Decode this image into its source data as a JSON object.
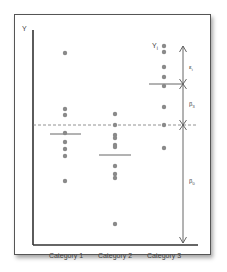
{
  "diagram": {
    "y_axis_label": "Y",
    "point_label": "Y",
    "point_label_sub": "i",
    "categories": [
      "Category 1",
      "Category 2",
      "Category 3"
    ],
    "annotations": {
      "epsilon": {
        "symbol": "ε",
        "sub": "i"
      },
      "beta3": {
        "symbol": "β",
        "sub": "3"
      },
      "beta0": {
        "symbol": "β",
        "sub": "0"
      }
    },
    "colors": {
      "dot": "#8a8a8a",
      "axis": "#333333",
      "mean_line": "#666666",
      "dashed": "#777777"
    }
  },
  "chart_data": {
    "type": "scatter",
    "title": "",
    "xlabel": "",
    "ylabel": "Y",
    "categories": [
      "Category 1",
      "Category 2",
      "Category 3"
    ],
    "series": [
      {
        "name": "Category 1",
        "pixel_y": [
          53,
          109,
          115,
          133,
          142,
          149,
          156,
          181
        ],
        "mean_pixel_y": 131
      },
      {
        "name": "Category 2",
        "pixel_y": [
          114,
          125,
          135,
          138,
          145,
          147,
          166,
          174,
          178,
          224
        ],
        "mean_pixel_y": 155
      },
      {
        "name": "Category 3",
        "pixel_y": [
          46,
          52,
          67,
          77,
          86,
          107,
          125,
          148
        ],
        "mean_pixel_y": 84
      }
    ],
    "reference_line_pixel_y": 125,
    "grid": false
  }
}
